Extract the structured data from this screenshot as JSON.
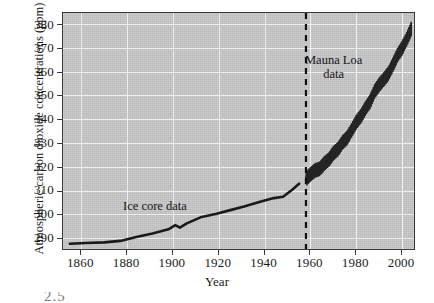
{
  "chart_data": {
    "type": "line",
    "title": "",
    "xlabel": "Year",
    "ylabel": "Atmospheric carbon dioxide concentrations (ppm)",
    "xlim": [
      1852,
      2006
    ],
    "ylim": [
      285,
      384
    ],
    "xticks": [
      1860,
      1880,
      1900,
      1920,
      1940,
      1960,
      1980,
      2000
    ],
    "yticks": [
      290,
      300,
      310,
      320,
      330,
      340,
      350,
      360,
      370,
      380
    ],
    "grid": true,
    "legend_position": "in-plot annotations",
    "plot_background_color": "#c8c8c8",
    "gridline_color": "#f2f2f2",
    "series_color": "#1a1a1a",
    "annotations": [
      {
        "name": "ice-core-data",
        "text": "Ice core data",
        "x": 1900,
        "y": 309
      },
      {
        "name": "mauna-loa-data",
        "text_line1": "Mauna Loa",
        "text_line2": "data",
        "x": 1975,
        "y": 363
      }
    ],
    "divider": {
      "name": "record-transition-divider",
      "style": "dashed",
      "x": 1958
    },
    "series": [
      {
        "name": "Ice core data",
        "style": "solid-line",
        "x": [
          1855,
          1862,
          1870,
          1877,
          1884,
          1891,
          1898,
          1901,
          1903,
          1906,
          1912,
          1919,
          1925,
          1931,
          1938,
          1944,
          1948,
          1952,
          1955
        ],
        "values": [
          288.0,
          288.3,
          288.6,
          289.2,
          290.8,
          292.3,
          294.0,
          295.8,
          294.7,
          296.5,
          299.0,
          300.5,
          302.0,
          303.5,
          305.5,
          307.0,
          307.6,
          310.5,
          313.0
        ]
      },
      {
        "name": "Mauna Loa data",
        "style": "seasonal-oscillation-band",
        "x": [
          1958,
          1960,
          1962,
          1964,
          1966,
          1968,
          1970,
          1972,
          1974,
          1976,
          1978,
          1980,
          1982,
          1984,
          1986,
          1988,
          1990,
          1992,
          1994,
          1996,
          1998,
          2000,
          2002,
          2004
        ],
        "values": [
          315.0,
          316.9,
          318.5,
          319.2,
          321.4,
          323.0,
          325.7,
          327.4,
          330.2,
          332.1,
          335.4,
          338.7,
          341.1,
          344.4,
          347.2,
          351.5,
          354.2,
          356.4,
          358.8,
          362.6,
          366.6,
          369.5,
          373.2,
          377.5
        ]
      }
    ]
  },
  "axis": {
    "y_title": "Atmospheric carbon dioxide concentrations (ppm)",
    "x_title": "Year",
    "y_ticks": [
      "380",
      "370",
      "360",
      "350",
      "340",
      "330",
      "320",
      "310",
      "300",
      "290"
    ],
    "x_ticks": [
      "1860",
      "1880",
      "1900",
      "1920",
      "1940",
      "1960",
      "1980",
      "2000"
    ]
  },
  "annotations": {
    "ice_core": "Ice core data",
    "mauna_loa_line1": "Mauna Loa",
    "mauna_loa_line2": "data"
  },
  "artifact": {
    "bottom_text": "2.5"
  }
}
